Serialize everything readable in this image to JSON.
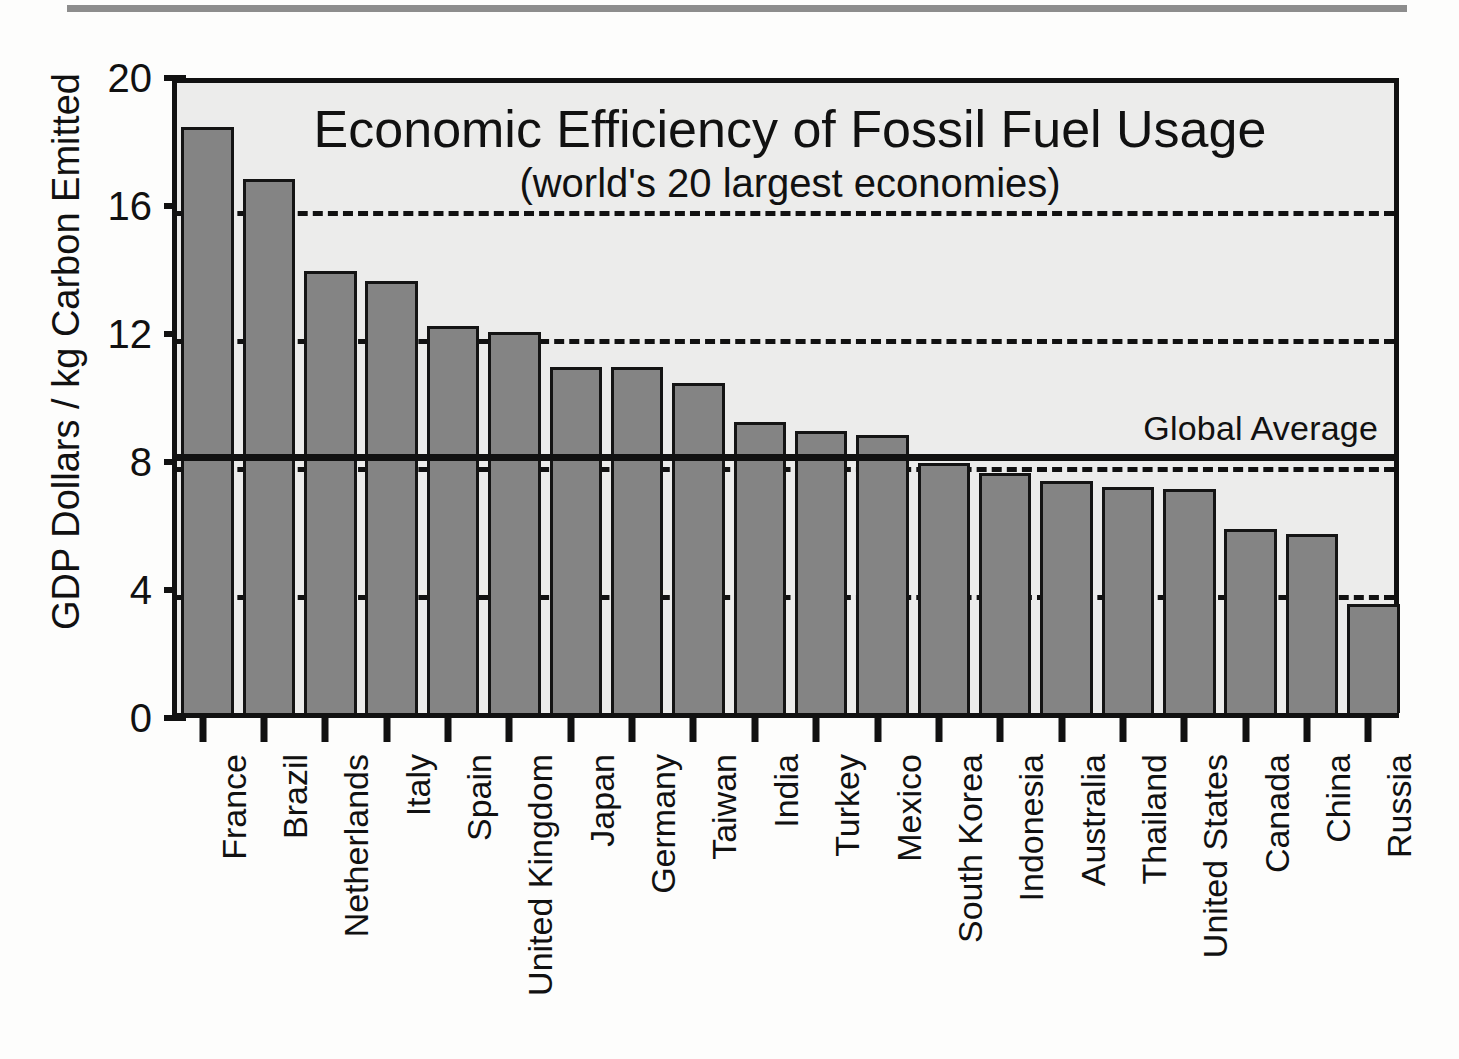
{
  "chart_data": {
    "type": "bar",
    "title": "Economic Efficiency of Fossil Fuel Usage",
    "subtitle": "(world's 20 largest economies)",
    "xlabel": "",
    "ylabel": "GDP Dollars / kg Carbon Emitted",
    "ylim": [
      0,
      20
    ],
    "yticks": [
      0,
      4,
      8,
      12,
      16,
      20
    ],
    "ytick_labels": [
      "0",
      "4",
      "8",
      "12",
      "16",
      "20"
    ],
    "grid": "dashed horizontal gridlines at 4, 8, 12, 16",
    "legend": "none",
    "bar_color": "#848484",
    "bar_edge_color": "#141414",
    "plot_background": "#ececeb",
    "annotations": [
      {
        "name": "global-average",
        "label": "Global Average",
        "value": 8.3,
        "style": "solid horizontal reference line across full plot width"
      }
    ],
    "categories": [
      "France",
      "Brazil",
      "Netherlands",
      "Italy",
      "Spain",
      "United Kingdom",
      "Japan",
      "Germany",
      "Taiwan",
      "India",
      "Turkey",
      "Mexico",
      "South Korea",
      "Indonesia",
      "Australia",
      "Thailand",
      "United States",
      "Canada",
      "China",
      "Russia"
    ],
    "values": [
      18.3,
      16.7,
      13.8,
      13.5,
      12.1,
      11.9,
      10.8,
      10.8,
      10.3,
      9.1,
      8.8,
      8.7,
      7.8,
      7.5,
      7.25,
      7.05,
      7.0,
      5.75,
      5.6,
      3.4
    ]
  }
}
